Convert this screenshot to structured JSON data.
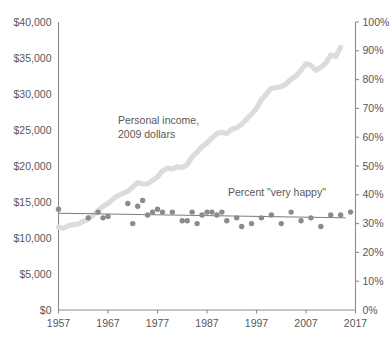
{
  "chart_data": {
    "type": "line",
    "title": "",
    "subtitle": "",
    "xlabel": "",
    "ylabel": "",
    "grid": false,
    "legend_position": "inline-annotations",
    "xlim": [
      1957,
      2017
    ],
    "x_ticks": [
      "1957",
      "1967",
      "1977",
      "1987",
      "1997",
      "2007",
      "2017"
    ],
    "x_tick_values": [
      1957,
      1967,
      1977,
      1987,
      1997,
      2007,
      2017
    ],
    "left_axis": {
      "label": "",
      "ylim": [
        0,
        40000
      ],
      "ticks": [
        "$0",
        "$5,000",
        "$10,000",
        "$15,000",
        "$20,000",
        "$25,000",
        "$30,000",
        "$35,000",
        "$40,000"
      ],
      "tick_values": [
        0,
        5000,
        10000,
        15000,
        20000,
        25000,
        30000,
        35000,
        40000
      ]
    },
    "right_axis": {
      "label": "",
      "ylim": [
        0,
        100
      ],
      "ticks": [
        "0%",
        "10%",
        "20%",
        "30%",
        "40%",
        "50%",
        "60%",
        "70%",
        "80%",
        "90%",
        "100%"
      ],
      "tick_values": [
        0,
        10,
        20,
        30,
        40,
        50,
        60,
        70,
        80,
        90,
        100
      ]
    },
    "annotations": [
      {
        "name": "income-annotation",
        "text_line1": "Personal income,",
        "text_line2": "2009 dollars",
        "x": 1972,
        "y_pct": 70
      },
      {
        "name": "happy-annotation",
        "text": "Percent \"very happy\"",
        "x": 1998,
        "y_pct": 40
      }
    ],
    "series": [
      {
        "name": "Personal income, 2009 dollars",
        "type": "line",
        "axis": "left",
        "color": "#dcdcdc",
        "x": [
          1957,
          1958,
          1959,
          1960,
          1961,
          1962,
          1963,
          1964,
          1965,
          1966,
          1967,
          1968,
          1969,
          1970,
          1971,
          1972,
          1973,
          1974,
          1975,
          1976,
          1977,
          1978,
          1979,
          1980,
          1981,
          1982,
          1983,
          1984,
          1985,
          1986,
          1987,
          1988,
          1989,
          1990,
          1991,
          1992,
          1993,
          1994,
          1995,
          1996,
          1997,
          1998,
          1999,
          2000,
          2001,
          2002,
          2003,
          2004,
          2005,
          2006,
          2007,
          2008,
          2009,
          2010,
          2011,
          2012,
          2013,
          2014
        ],
        "values": [
          11500,
          11350,
          11700,
          11850,
          11950,
          12300,
          12600,
          13200,
          13800,
          14400,
          14800,
          15400,
          15900,
          16200,
          16500,
          17100,
          17700,
          17500,
          17500,
          18000,
          18500,
          19300,
          19700,
          19600,
          19900,
          19800,
          20200,
          21300,
          21900,
          22700,
          23200,
          23900,
          24500,
          24700,
          24500,
          25100,
          25300,
          25800,
          26500,
          27200,
          28000,
          29200,
          30000,
          30800,
          30900,
          31000,
          31400,
          32100,
          32500,
          33300,
          34200,
          34000,
          33300,
          33700,
          34300,
          35400,
          35200,
          36500
        ]
      },
      {
        "name": "Percent \"very happy\"",
        "type": "scatter",
        "axis": "right",
        "color": "#8b8b8d",
        "x": [
          1957,
          1963,
          1965,
          1966,
          1967,
          1971,
          1972,
          1973,
          1974,
          1975,
          1976,
          1977,
          1978,
          1980,
          1982,
          1983,
          1984,
          1985,
          1986,
          1987,
          1988,
          1989,
          1990,
          1991,
          1993,
          1994,
          1996,
          1998,
          2000,
          2002,
          2004,
          2006,
          2008,
          2010,
          2012,
          2014,
          2016
        ],
        "values": [
          35,
          32,
          34,
          32,
          32.5,
          37,
          30,
          36,
          38,
          33,
          34,
          35,
          34,
          34,
          31,
          31,
          34,
          30,
          33,
          34,
          34,
          33,
          34,
          31,
          32,
          29,
          30,
          32,
          33,
          30,
          34,
          31,
          32,
          29,
          33,
          33,
          34
        ]
      },
      {
        "name": "Percent \"very happy\" trend",
        "type": "line",
        "axis": "right",
        "color": "#7c7c7e",
        "x": [
          1957,
          2015
        ],
        "values": [
          33.6,
          32.0
        ]
      }
    ]
  }
}
